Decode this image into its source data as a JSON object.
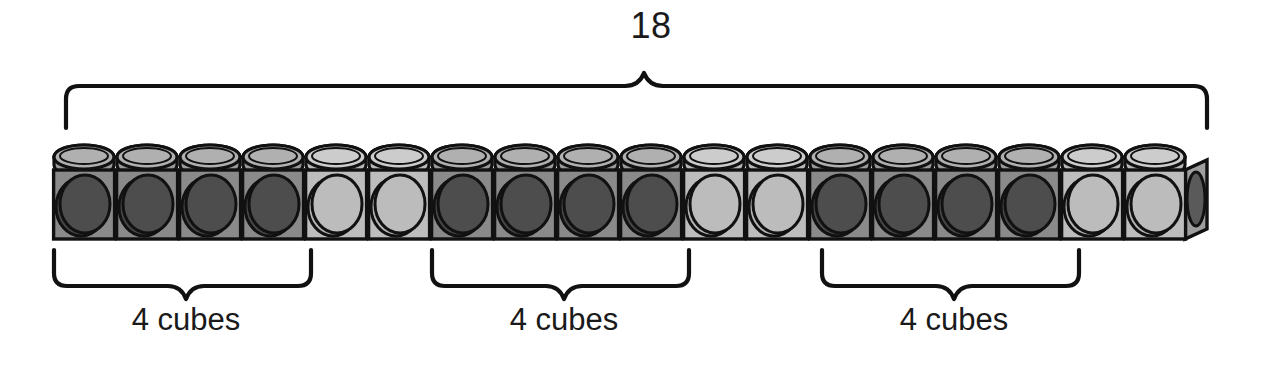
{
  "figure": {
    "type": "math-manipulative-diagram",
    "title_number": "18",
    "total_cubes": 18,
    "group_size": 4,
    "group_count": 3,
    "colors": {
      "dark_cube_body": "#8a8a8a",
      "dark_cube_disc": "#474747",
      "light_cube_body": "#bdbdbd",
      "light_cube_disc": "#b4b4b4",
      "stud_top": "#a8a8a8",
      "stud_top_light": "#c6c6c6",
      "outline": "#111111",
      "background": "#ffffff",
      "end_socket": "#5a5a5a"
    }
  },
  "top_brace": {
    "label": "18",
    "span_start_cube": 1,
    "span_end_cube": 18
  },
  "cube_train": {
    "name": "18-cube unifix train",
    "cubes": [
      {
        "index": 1,
        "shade": "dark"
      },
      {
        "index": 2,
        "shade": "dark"
      },
      {
        "index": 3,
        "shade": "dark"
      },
      {
        "index": 4,
        "shade": "dark"
      },
      {
        "index": 5,
        "shade": "light"
      },
      {
        "index": 6,
        "shade": "light"
      },
      {
        "index": 7,
        "shade": "dark"
      },
      {
        "index": 8,
        "shade": "dark"
      },
      {
        "index": 9,
        "shade": "dark"
      },
      {
        "index": 10,
        "shade": "dark"
      },
      {
        "index": 11,
        "shade": "light"
      },
      {
        "index": 12,
        "shade": "light"
      },
      {
        "index": 13,
        "shade": "dark"
      },
      {
        "index": 14,
        "shade": "dark"
      },
      {
        "index": 15,
        "shade": "dark"
      },
      {
        "index": 16,
        "shade": "dark"
      },
      {
        "index": 17,
        "shade": "light"
      },
      {
        "index": 18,
        "shade": "light"
      }
    ]
  },
  "bottom_braces": [
    {
      "id": 1,
      "label": "4 cubes",
      "cubes_covered": 4,
      "first_cube": 1,
      "last_cube": 4
    },
    {
      "id": 2,
      "label": "4 cubes",
      "cubes_covered": 4,
      "first_cube": 7,
      "last_cube": 10
    },
    {
      "id": 3,
      "label": "4 cubes",
      "cubes_covered": 4,
      "first_cube": 13,
      "last_cube": 16
    }
  ]
}
